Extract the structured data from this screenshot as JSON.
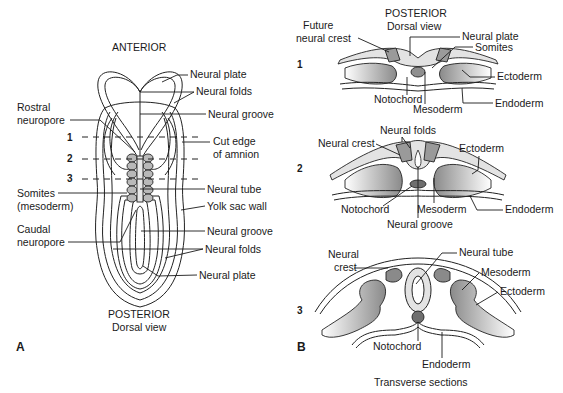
{
  "panel_a": {
    "panel_label": "A",
    "top_title": "ANTERIOR",
    "bottom_title": "POSTERIOR",
    "bottom_subtitle": "Dorsal view",
    "section_markers": [
      "1",
      "2",
      "3"
    ],
    "labels_right": [
      "Neural plate",
      "Neural folds",
      "Neural groove",
      "Cut edge",
      "of amnion",
      "Neural tube",
      "Yolk sac wall",
      "Neural groove",
      "Neural folds",
      "Neural plate"
    ],
    "labels_left": [
      "Rostral",
      "neuropore",
      "Somites",
      "(mesoderm)",
      "Caudal",
      "neuropore"
    ]
  },
  "panel_b": {
    "panel_label": "B",
    "top_title": "POSTERIOR",
    "top_subtitle": "Dorsal view",
    "footer": "Transverse sections",
    "section1": {
      "number": "1",
      "labels": [
        "Future",
        "neural crest",
        "Neural plate",
        "Somites",
        "Ectoderm",
        "Notochord",
        "Mesoderm",
        "Endoderm"
      ]
    },
    "section2": {
      "number": "2",
      "labels": [
        "Neural folds",
        "Neural crest",
        "Ectoderm",
        "Notochord",
        "Mesoderm",
        "Endoderm",
        "Neural groove"
      ]
    },
    "section3": {
      "number": "3",
      "labels": [
        "Neural",
        "crest",
        "Neural tube",
        "Mesoderm",
        "Ectoderm",
        "Notochord",
        "Endoderm"
      ]
    }
  },
  "colors": {
    "light_fill": "#e6e6e6",
    "mid_fill": "#bdbdbd",
    "dark_fill": "#7e7e7e",
    "outline": "#222222"
  }
}
